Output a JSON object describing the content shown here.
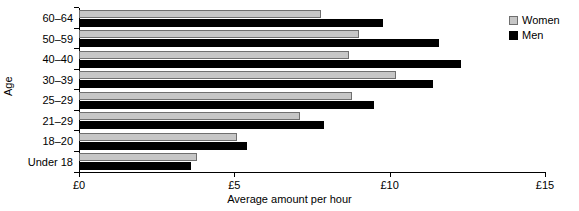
{
  "chart_data": {
    "type": "bar",
    "orientation": "horizontal",
    "title": "",
    "xlabel": "Average amount per hour",
    "ylabel": "Age",
    "categories": [
      "60–64",
      "50–59",
      "40–40",
      "30–39",
      "25–29",
      "21–29",
      "18–20",
      "Under 18"
    ],
    "series": [
      {
        "name": "Women",
        "color": "#c6c6c6",
        "values": [
          7.8,
          9.0,
          8.7,
          10.2,
          8.8,
          7.1,
          5.1,
          3.8
        ]
      },
      {
        "name": "Men",
        "color": "#000000",
        "values": [
          9.8,
          11.6,
          12.3,
          11.4,
          9.5,
          7.9,
          5.4,
          3.6
        ]
      }
    ],
    "xlim": [
      0,
      15
    ],
    "xticks": [
      0,
      5,
      10,
      15
    ],
    "xtick_labels": [
      "£0",
      "£5",
      "£10",
      "£15"
    ],
    "grid": false,
    "legend_position": "top-right"
  },
  "legend": {
    "items": [
      {
        "label": "Women",
        "swatch": "women-swatch"
      },
      {
        "label": "Men",
        "swatch": "men-swatch"
      }
    ]
  }
}
